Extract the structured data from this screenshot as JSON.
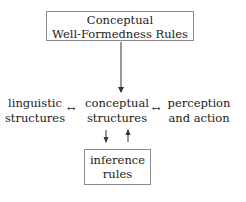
{
  "diagram": {
    "top_box": {
      "line1": "Conceptual",
      "line2": "Well-Formedness Rules"
    },
    "left_node": {
      "line1": "linguistic",
      "line2": "structures"
    },
    "center_node": {
      "line1": "conceptual",
      "line2": "structures"
    },
    "right_node": {
      "line1": "perception",
      "line2": "and action"
    },
    "bottom_box": {
      "line1": "inference",
      "line2": "rules"
    },
    "arrows": {
      "left_link": "↔",
      "right_link": "↔",
      "top_to_center": "down",
      "center_to_bottom": "down",
      "bottom_to_center": "up"
    },
    "colors": {
      "line": "#333333",
      "box_border": "#8a8a8a",
      "text": "#222222"
    }
  }
}
